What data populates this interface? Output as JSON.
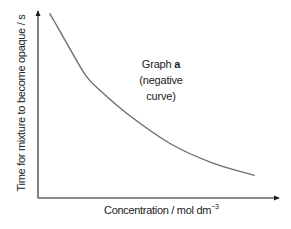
{
  "chart_data": {
    "type": "line",
    "title": "",
    "xlabel": "Concentration / mol dm⁻³",
    "xlabel_base": "Concentration / mol dm",
    "xlabel_exponent": "−3",
    "ylabel": "Time for mixture to become opaque / s",
    "grid": false,
    "legend": null,
    "ticks": {
      "x": [],
      "y": []
    },
    "annotation": {
      "line1_prefix": "Graph ",
      "line1_bold": "a",
      "line2": "(negative curve)"
    },
    "series": [
      {
        "name": "Graph a (negative curve)",
        "shape": "decreasing curve, concave up (inverse relationship)",
        "color": "#6e6e6e",
        "points_relative": [
          {
            "x": 0.05,
            "y": 0.98
          },
          {
            "x": 0.09,
            "y": 0.89
          },
          {
            "x": 0.13,
            "y": 0.8
          },
          {
            "x": 0.2,
            "y": 0.65
          },
          {
            "x": 0.26,
            "y": 0.57
          },
          {
            "x": 0.38,
            "y": 0.44
          },
          {
            "x": 0.55,
            "y": 0.29
          },
          {
            "x": 0.72,
            "y": 0.19
          },
          {
            "x": 0.9,
            "y": 0.12
          }
        ]
      }
    ]
  },
  "colors": {
    "axis": "#1a1a1a",
    "curve": "#6e6e6e",
    "text": "#222222"
  }
}
